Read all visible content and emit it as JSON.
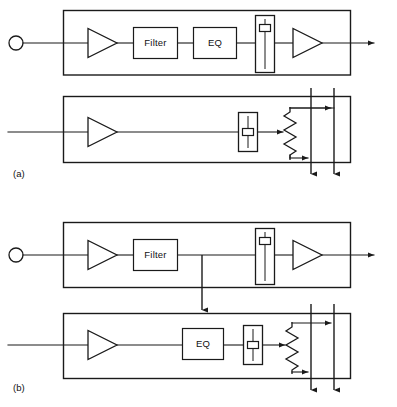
{
  "figure": {
    "type": "signal-flow-block-diagram",
    "width": 397,
    "height": 407,
    "background_color": "#ffffff",
    "line_color": "#1a1a1a"
  },
  "panels": [
    {
      "id": "a",
      "label": "(a)",
      "channels": [
        {
          "id": "a-top",
          "role": "input-channel-strip",
          "input_connector": "circle-jack",
          "elements": [
            {
              "kind": "amplifier",
              "label": ""
            },
            {
              "kind": "process-box",
              "label": "Filter"
            },
            {
              "kind": "process-box",
              "label": "EQ"
            },
            {
              "kind": "fader",
              "label": ""
            },
            {
              "kind": "amplifier",
              "label": ""
            }
          ],
          "output": "arrow-right"
        },
        {
          "id": "a-bottom",
          "role": "output-bus-strip",
          "input_connector": "wire",
          "elements": [
            {
              "kind": "amplifier",
              "label": ""
            },
            {
              "kind": "fader",
              "label": ""
            },
            {
              "kind": "pan-resistor",
              "label": ""
            }
          ],
          "bus_count": 2,
          "output": "two-bus-down-arrows"
        }
      ]
    },
    {
      "id": "b",
      "label": "(b)",
      "channels": [
        {
          "id": "b-top",
          "role": "input-channel-strip",
          "input_connector": "circle-jack",
          "elements": [
            {
              "kind": "amplifier",
              "label": ""
            },
            {
              "kind": "process-box",
              "label": "Filter"
            },
            {
              "kind": "fader",
              "label": ""
            },
            {
              "kind": "amplifier",
              "label": ""
            }
          ],
          "output": "arrow-right",
          "tap": "arrow-down-to-lower-strip"
        },
        {
          "id": "b-bottom",
          "role": "output-bus-strip",
          "input_connector": "wire",
          "elements": [
            {
              "kind": "amplifier",
              "label": ""
            },
            {
              "kind": "process-box",
              "label": "EQ"
            },
            {
              "kind": "fader",
              "label": ""
            },
            {
              "kind": "pan-resistor",
              "label": ""
            }
          ],
          "bus_count": 2,
          "output": "two-bus-down-arrows"
        }
      ]
    }
  ],
  "labels": {
    "filter": "Filter",
    "eq": "EQ",
    "panel_a": "(a)",
    "panel_b": "(b)"
  }
}
